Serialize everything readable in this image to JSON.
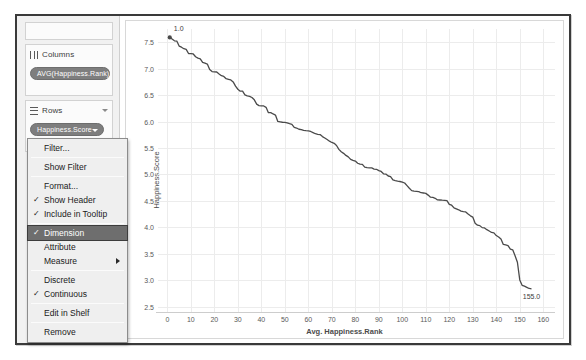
{
  "window": {
    "title": ""
  },
  "shelves": {
    "columns": {
      "icon": "columns-icon",
      "label": "Columns",
      "pill": "AVG(Happiness.Rank)"
    },
    "rows": {
      "icon": "rows-icon",
      "label": "Rows",
      "pill": "Happiness.Score"
    }
  },
  "context_menu": {
    "groups": [
      {
        "items": [
          {
            "label": "Filter...",
            "checked": false,
            "selected": false,
            "submenu": false
          }
        ]
      },
      {
        "items": [
          {
            "label": "Show Filter",
            "checked": false,
            "selected": false,
            "submenu": false
          }
        ]
      },
      {
        "items": [
          {
            "label": "Format...",
            "checked": false,
            "selected": false,
            "submenu": false
          },
          {
            "label": "Show Header",
            "checked": true,
            "selected": false,
            "submenu": false
          },
          {
            "label": "Include in Tooltip",
            "checked": true,
            "selected": false,
            "submenu": false
          }
        ]
      },
      {
        "items": [
          {
            "label": "Dimension",
            "checked": true,
            "selected": true,
            "submenu": false
          },
          {
            "label": "Attribute",
            "checked": false,
            "selected": false,
            "submenu": false
          },
          {
            "label": "Measure",
            "checked": false,
            "selected": false,
            "submenu": true
          }
        ]
      },
      {
        "items": [
          {
            "label": "Discrete",
            "checked": false,
            "selected": false,
            "submenu": false
          },
          {
            "label": "Continuous",
            "checked": true,
            "selected": false,
            "submenu": false
          }
        ]
      },
      {
        "items": [
          {
            "label": "Edit in Shelf",
            "checked": false,
            "selected": false,
            "submenu": false
          }
        ]
      },
      {
        "items": [
          {
            "label": "Remove",
            "checked": false,
            "selected": false,
            "submenu": false
          }
        ]
      }
    ]
  },
  "colors": {
    "line": "#4a4a4a",
    "grid": "#ececec",
    "pill": "#7e7e7e",
    "selection": "#6e6e6e",
    "frame": "#3a3a3a"
  },
  "chart_data": {
    "type": "line",
    "title": "",
    "xlabel": "Avg. Happiness.Rank",
    "ylabel": "Happiness.Score",
    "xlim": [
      -4,
      165
    ],
    "ylim": [
      2.4,
      7.75
    ],
    "xticks": [
      0,
      10,
      20,
      30,
      40,
      50,
      60,
      70,
      80,
      90,
      100,
      110,
      120,
      130,
      140,
      150,
      160
    ],
    "yticks": [
      2.5,
      3.0,
      3.5,
      4.0,
      4.5,
      5.0,
      5.5,
      6.0,
      6.5,
      7.0,
      7.5
    ],
    "grid": true,
    "legend": false,
    "annotations": [
      {
        "text": "1.0",
        "x": 1,
        "y": 7.59,
        "marker": true,
        "position": "above-right"
      },
      {
        "text": "155.0",
        "x": 155,
        "y": 2.84,
        "marker": false,
        "position": "below"
      }
    ],
    "series": [
      {
        "name": "Happiness.Score",
        "x": [
          1,
          2,
          3,
          4,
          5,
          6,
          7,
          8,
          9,
          10,
          11,
          12,
          13,
          14,
          15,
          16,
          17,
          18,
          19,
          20,
          21,
          22,
          23,
          24,
          25,
          26,
          27,
          28,
          29,
          30,
          31,
          32,
          33,
          34,
          35,
          36,
          37,
          38,
          39,
          40,
          41,
          42,
          43,
          44,
          45,
          46,
          47,
          48,
          49,
          50,
          51,
          52,
          53,
          54,
          55,
          56,
          57,
          58,
          59,
          60,
          61,
          62,
          63,
          64,
          65,
          66,
          67,
          68,
          69,
          70,
          71,
          72,
          73,
          74,
          75,
          76,
          77,
          78,
          79,
          80,
          81,
          82,
          83,
          84,
          85,
          86,
          87,
          88,
          89,
          90,
          91,
          92,
          93,
          94,
          95,
          96,
          97,
          98,
          99,
          100,
          101,
          102,
          103,
          104,
          105,
          106,
          107,
          108,
          109,
          110,
          111,
          112,
          113,
          114,
          115,
          116,
          117,
          118,
          119,
          120,
          121,
          122,
          123,
          124,
          125,
          126,
          127,
          128,
          129,
          130,
          131,
          132,
          133,
          134,
          135,
          136,
          137,
          138,
          139,
          140,
          141,
          142,
          143,
          144,
          145,
          146,
          147,
          148,
          149,
          150,
          151,
          152,
          153,
          154,
          155
        ],
        "y": [
          7.587,
          7.561,
          7.527,
          7.522,
          7.427,
          7.406,
          7.378,
          7.364,
          7.286,
          7.284,
          7.278,
          7.226,
          7.2,
          7.187,
          7.119,
          7.104,
          7.087,
          6.983,
          6.946,
          6.94,
          6.937,
          6.901,
          6.867,
          6.853,
          6.81,
          6.798,
          6.786,
          6.75,
          6.67,
          6.611,
          6.575,
          6.574,
          6.505,
          6.485,
          6.477,
          6.455,
          6.411,
          6.329,
          6.302,
          6.298,
          6.295,
          6.269,
          6.168,
          6.168,
          6.144,
          6.123,
          6.003,
          5.995,
          5.987,
          5.984,
          5.975,
          5.96,
          5.948,
          5.889,
          5.878,
          5.855,
          5.848,
          5.833,
          5.828,
          5.824,
          5.813,
          5.791,
          5.77,
          5.759,
          5.754,
          5.716,
          5.689,
          5.66,
          5.629,
          5.605,
          5.589,
          5.548,
          5.474,
          5.429,
          5.399,
          5.36,
          5.332,
          5.286,
          5.268,
          5.253,
          5.212,
          5.194,
          5.192,
          5.14,
          5.129,
          5.124,
          5.123,
          5.102,
          5.098,
          5.073,
          5.057,
          5.013,
          5.007,
          4.971,
          4.959,
          4.898,
          4.885,
          4.874,
          4.867,
          4.857,
          4.839,
          4.788,
          4.739,
          4.694,
          4.686,
          4.681,
          4.677,
          4.655,
          4.65,
          4.642,
          4.61,
          4.571,
          4.565,
          4.55,
          4.518,
          4.517,
          4.514,
          4.512,
          4.507,
          4.436,
          4.419,
          4.369,
          4.35,
          4.332,
          4.307,
          4.297,
          4.292,
          4.252,
          4.218,
          4.194,
          4.077,
          4.041,
          4.033,
          3.995,
          3.989,
          3.956,
          3.931,
          3.904,
          3.896,
          3.845,
          3.819,
          3.781,
          3.678,
          3.667,
          3.655,
          3.587,
          3.575,
          3.465,
          3.34,
          3.006,
          2.905,
          2.889,
          2.867,
          2.845,
          2.839
        ]
      }
    ]
  }
}
